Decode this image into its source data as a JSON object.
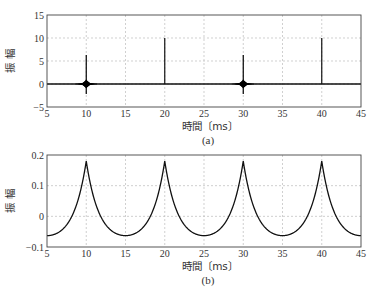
{
  "chart_data": [
    {
      "id": "a",
      "type": "line",
      "caption": "(a)",
      "title": "",
      "xlabel": "時間〔ms〕",
      "ylabel": "振 幅",
      "xlim": [
        5,
        45
      ],
      "ylim": [
        -5,
        15
      ],
      "xticks": [
        5,
        10,
        15,
        20,
        25,
        30,
        35,
        40,
        45
      ],
      "yticks": [
        -5,
        0,
        5,
        10,
        15
      ],
      "xtick_labels": [
        "5",
        "10",
        "15",
        "20",
        "25",
        "30",
        "35",
        "40",
        "45"
      ],
      "ytick_labels": [
        "−5",
        "0",
        "5",
        "10",
        "15"
      ],
      "grid": true,
      "description": "Baseline at 0 with impulse-like spikes: ringing bursts at 10 and 30 ms (peak ~6.3, min ~-2.2) and clean spikes at 20 and 40 ms (~10).",
      "series": [
        {
          "name": "signal",
          "events": [
            {
              "x": 10,
              "peak": 6.3,
              "trough": -2.2,
              "burst": true
            },
            {
              "x": 20,
              "peak": 10,
              "trough": 0,
              "burst": false
            },
            {
              "x": 30,
              "peak": 6.3,
              "trough": -2.2,
              "burst": true
            },
            {
              "x": 40,
              "peak": 10,
              "trough": 0,
              "burst": false
            }
          ]
        }
      ]
    },
    {
      "id": "b",
      "type": "line",
      "caption": "(b)",
      "title": "",
      "xlabel": "時間〔ms〕",
      "ylabel": "振 幅",
      "xlim": [
        5,
        45
      ],
      "ylim": [
        -0.1,
        0.2
      ],
      "xticks": [
        5,
        10,
        15,
        20,
        25,
        30,
        35,
        40,
        45
      ],
      "yticks": [
        -0.1,
        0,
        0.1,
        0.2
      ],
      "xtick_labels": [
        "5",
        "10",
        "15",
        "20",
        "25",
        "30",
        "35",
        "40",
        "45"
      ],
      "ytick_labels": [
        "−0.1",
        "0",
        "0.1",
        "0.2"
      ],
      "grid": true,
      "description": "Periodic cusp-shaped waveform with period 10 ms, peaks ~0.18 at 10, 20, 30, 40 ms, minima ~-0.063 at 5, 15, 25, 35, 45 ms.",
      "series": [
        {
          "name": "signal",
          "x": [
            5,
            7.5,
            9,
            10,
            11,
            12.5,
            15,
            17.5,
            19,
            20,
            21,
            22.5,
            25,
            27.5,
            29,
            30,
            31,
            32.5,
            35,
            37.5,
            39,
            40,
            41,
            42.5,
            45
          ],
          "y": [
            -0.063,
            -0.03,
            0.06,
            0.18,
            0.06,
            -0.03,
            -0.063,
            -0.03,
            0.06,
            0.18,
            0.06,
            -0.03,
            -0.063,
            -0.03,
            0.06,
            0.18,
            0.06,
            -0.03,
            -0.063,
            -0.03,
            0.06,
            0.18,
            0.06,
            -0.03,
            -0.063
          ]
        }
      ]
    }
  ]
}
